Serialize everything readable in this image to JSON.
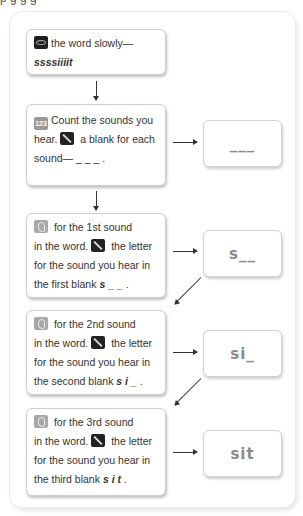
{
  "top_clipped_text": "p      g       g       g",
  "steps": [
    {
      "icon": "eye-icon",
      "text": "the word slowly—",
      "emphasis": "ssssiiiit"
    },
    {
      "icon": "numbers-123-icon",
      "line1": "Count the sounds you",
      "line2_pre": "hear.",
      "line2_icon": "pencil-icon",
      "line2_post": "a blank for each",
      "line3": "sound— _ _ _ ."
    },
    {
      "icon": "ear-icon",
      "line1": "for the 1st sound",
      "line2_pre": "in the word.",
      "line2_icon": "pencil-icon",
      "line2_post": "the letter",
      "line3": "for the sound you hear in",
      "line4_pre": "the first blank",
      "line4_bold": "s _ _",
      "line4_post": "."
    },
    {
      "icon": "ear-icon",
      "line1": "for the 2nd sound",
      "line2_pre": "in the word.",
      "line2_icon": "pencil-icon",
      "line2_post": "the letter",
      "line3": "for the sound you hear in",
      "line4_pre": "the second blank",
      "line4_bold": "s i _",
      "line4_post": "."
    },
    {
      "icon": "ear-icon",
      "line1": "for the 3rd sound",
      "line2_pre": "in the word.",
      "line2_icon": "pencil-icon",
      "line2_post": "the letter",
      "line3": "for the sound you hear in",
      "line4_pre": "the third blank",
      "line4_bold": "s i t",
      "line4_post": "."
    }
  ],
  "results": [
    "___",
    "s__",
    "si_",
    "sit"
  ],
  "colors": {
    "border": "#cfcfcf",
    "result_text": "#8a8a8a",
    "arrow": "#333333"
  }
}
